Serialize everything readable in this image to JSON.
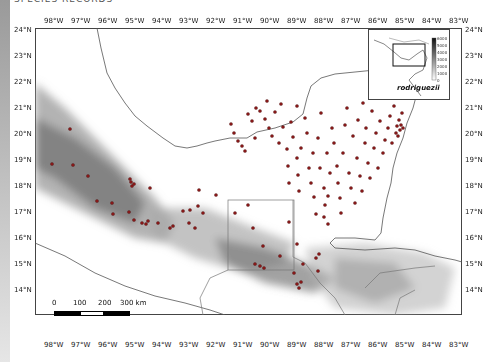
{
  "figure": {
    "caption_fragment": "SPECIES RECORDS",
    "species_label": "rodriguezii",
    "point_color": "#8b1a1a"
  },
  "axes": {
    "x_ticks": [
      "98°W",
      "97°W",
      "96°W",
      "95°W",
      "94°W",
      "93°W",
      "92°W",
      "91°W",
      "90°W",
      "89°W",
      "88°W",
      "87°W",
      "86°W",
      "85°W",
      "84°W",
      "83°W"
    ],
    "y_ticks": [
      "24°N",
      "23°N",
      "22°N",
      "21°N",
      "20°N",
      "19°N",
      "18°N",
      "17°N",
      "16°N",
      "15°N",
      "14°N"
    ]
  },
  "elevation_legend": {
    "unit": "m",
    "labels": [
      "6000",
      "5000",
      "4000",
      "3000",
      "2000",
      "1000",
      "0"
    ]
  },
  "scale_bar": {
    "labels": [
      "0",
      "100",
      "200",
      "300 km"
    ]
  }
}
